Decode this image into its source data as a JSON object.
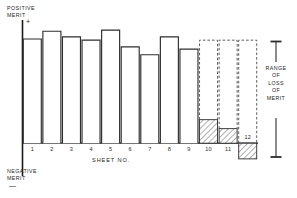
{
  "labels": {
    "positive_merit": "POSITIVE\nMERIT",
    "positive_merit_line1": "POSITIVE",
    "positive_merit_line2": "MERIT",
    "plus_sign": "+",
    "negative_merit_line1": "NEGATIVE",
    "negative_merit_line2": "MERIT",
    "minus_sign": "—",
    "axis_title": "SHEET   No.",
    "legend_line1": "RANGE",
    "legend_line2": "OF",
    "legend_line3": "LOSS",
    "legend_line4": "OF",
    "legend_line5": "MERIT"
  },
  "colors": {
    "ink": "#1a1a1a",
    "bar_outline": "#2e2e2e",
    "bar_fill": "#ffffff",
    "hatch_fill": "#ffffff",
    "hatch_line": "#3a3a3a",
    "dashed_outline": "#4a4a4a",
    "axis": "#1a1a1a",
    "background": "#ffffff"
  },
  "chart_data": {
    "type": "bar",
    "title": "",
    "xlabel": "SHEET No.",
    "ylabel": "MERIT",
    "grid": false,
    "legend_position": "right",
    "ylim": [
      -0.18,
      1.0
    ],
    "baseline": 0,
    "categories": [
      "1",
      "2",
      "3",
      "4",
      "5",
      "6",
      "7",
      "8",
      "9",
      "10",
      "11",
      "12"
    ],
    "tick_labels": [
      "1",
      "2",
      "3",
      "4",
      "5",
      "6",
      "7",
      "8",
      "9",
      "10",
      "11",
      "12"
    ],
    "series": [
      {
        "name": "Actual merit",
        "style": "solid-outline",
        "values": [
          0.93,
          1.0,
          0.95,
          0.92,
          1.01,
          0.86,
          0.79,
          0.95,
          0.84,
          0.21,
          0.13,
          -0.14
        ]
      },
      {
        "name": "Potential merit (dashed)",
        "style": "dashed-outline",
        "values": [
          null,
          null,
          null,
          null,
          null,
          null,
          null,
          null,
          null,
          0.92,
          0.92,
          0.92
        ]
      }
    ],
    "hatched_bars": [
      "10",
      "11",
      "12"
    ],
    "dashed_bars": [
      "10",
      "11",
      "12"
    ],
    "annotations": [
      {
        "text": "RANGE OF LOSS OF MERIT",
        "position": "right",
        "type": "double-arrow"
      }
    ]
  },
  "bars": [
    {
      "id": "1",
      "label": "1",
      "top_value": 0.93,
      "hatched": false,
      "dashed": false
    },
    {
      "id": "2",
      "label": "2",
      "top_value": 1.0,
      "hatched": false,
      "dashed": false
    },
    {
      "id": "3",
      "label": "3",
      "top_value": 0.95,
      "hatched": false,
      "dashed": false
    },
    {
      "id": "4",
      "label": "4",
      "top_value": 0.92,
      "hatched": false,
      "dashed": false
    },
    {
      "id": "5",
      "label": "5",
      "top_value": 1.01,
      "hatched": false,
      "dashed": false
    },
    {
      "id": "6",
      "label": "6",
      "top_value": 0.86,
      "hatched": false,
      "dashed": false
    },
    {
      "id": "7",
      "label": "7",
      "top_value": 0.79,
      "hatched": false,
      "dashed": false
    },
    {
      "id": "8",
      "label": "8",
      "top_value": 0.95,
      "hatched": false,
      "dashed": false
    },
    {
      "id": "9",
      "label": "9",
      "top_value": 0.84,
      "hatched": false,
      "dashed": false
    },
    {
      "id": "10",
      "label": "10",
      "top_value": 0.21,
      "hatched": true,
      "dashed": true,
      "dashed_top": 0.92
    },
    {
      "id": "11",
      "label": "11",
      "top_value": 0.13,
      "hatched": true,
      "dashed": true,
      "dashed_top": 0.92
    },
    {
      "id": "12",
      "label": "12",
      "top_value": -0.14,
      "hatched": true,
      "dashed": true,
      "dashed_top": 0.92
    }
  ]
}
